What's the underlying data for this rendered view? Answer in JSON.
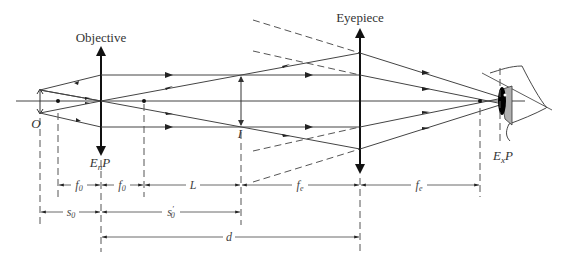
{
  "labels": {
    "objective": "Objective",
    "eyepiece": "Eyepiece",
    "object": "O",
    "intermediate_image": "I",
    "entrance_pupil": "EnP",
    "entrance_pupil_main": "E",
    "entrance_pupil_sub": "n",
    "entrance_pupil_end": "P",
    "exit_pupil_main": "E",
    "exit_pupil_sub": "x",
    "exit_pupil_end": "P"
  },
  "dimensions": {
    "row1": [
      {
        "label_main": "f",
        "label_sub": "0",
        "from": "F0",
        "to": "objective"
      },
      {
        "label_main": "f",
        "label_sub": "0",
        "from": "objective",
        "to": "F0'"
      },
      {
        "label_main": "L",
        "label_sub": "",
        "from": "F0'",
        "to": "I"
      },
      {
        "label_main": "f",
        "label_sub": "e",
        "from": "I",
        "to": "eyepiece"
      },
      {
        "label_main": "f",
        "label_sub": "e",
        "from": "eyepiece",
        "to": "Fe'"
      }
    ],
    "row2": [
      {
        "label_main": "s",
        "label_sub": "0",
        "prime": "",
        "from": "O",
        "to": "objective"
      },
      {
        "label_main": "s",
        "label_sub": "0",
        "prime": "′",
        "from": "objective",
        "to": "I"
      }
    ],
    "row3": [
      {
        "label_main": "d",
        "label_sub": "",
        "from": "objective",
        "to": "eyepiece"
      }
    ]
  },
  "colors": {
    "line": "#444444",
    "lens": "#111111",
    "eye_lens_fill": "#b0b0b0",
    "pupil": "#000000"
  }
}
